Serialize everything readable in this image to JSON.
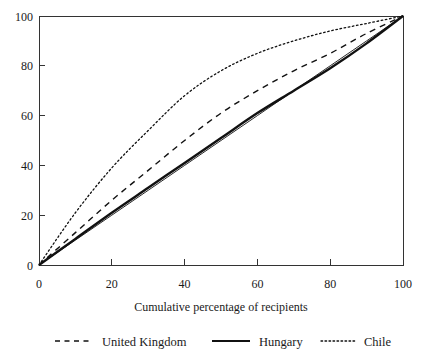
{
  "chart_data": {
    "type": "line",
    "title": "",
    "subtitle": "",
    "xlabel": "Cumulative percentage of recipients",
    "ylabel": "",
    "xlim": [
      0,
      100
    ],
    "ylim": [
      0,
      100
    ],
    "xticks": [
      0,
      20,
      40,
      60,
      80,
      100
    ],
    "yticks": [
      0,
      20,
      40,
      60,
      80,
      100
    ],
    "xtick_labels": [
      "0",
      "20",
      "40",
      "60",
      "80",
      "100"
    ],
    "ytick_labels": [
      "0",
      "20",
      "40",
      "60",
      "80",
      "100"
    ],
    "grid": false,
    "legend_position": "bottom",
    "x": [
      0,
      10,
      20,
      30,
      40,
      50,
      60,
      70,
      80,
      90,
      100
    ],
    "series": [
      {
        "name": "United Kingdom",
        "style": "dashed",
        "color": "#111111",
        "values": [
          0,
          13,
          26,
          38,
          50,
          61,
          70,
          78,
          85,
          93,
          100
        ]
      },
      {
        "name": "Hungary",
        "style": "solid",
        "color": "#111111",
        "values": [
          0,
          10.5,
          21,
          31,
          41,
          51,
          61,
          70,
          79,
          89,
          100
        ]
      },
      {
        "name": "Chile",
        "style": "dotted",
        "color": "#111111",
        "values": [
          0,
          21,
          39,
          54,
          68,
          78,
          85,
          90,
          94,
          97,
          100
        ]
      },
      {
        "name": "Line of equality",
        "style": "thin-solid",
        "color": "#111111",
        "values": [
          0,
          10,
          20,
          30,
          40,
          50,
          60,
          70,
          80,
          90,
          100
        ]
      }
    ],
    "legend": [
      {
        "label": "United Kingdom",
        "style": "dashed"
      },
      {
        "label": "Hungary",
        "style": "solid"
      },
      {
        "label": "Chile",
        "style": "dotted"
      }
    ]
  }
}
